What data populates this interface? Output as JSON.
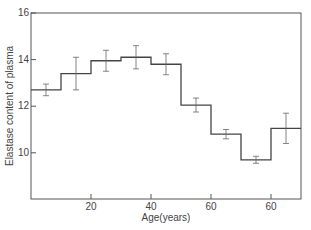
{
  "chart_data": {
    "type": "line",
    "style": "step histogram with error bars",
    "title": "",
    "xlabel": "Age(years)",
    "ylabel": "Elastase content of plasma",
    "xlim": [
      0,
      90
    ],
    "ylim": [
      8,
      16
    ],
    "x_tick_labels": [
      "20",
      "40",
      "60",
      "60"
    ],
    "x_tick_values": [
      20,
      40,
      60,
      80
    ],
    "y_ticks": [
      10,
      12,
      14,
      16
    ],
    "grid": false,
    "bins": [
      [
        0,
        10
      ],
      [
        10,
        20
      ],
      [
        20,
        30
      ],
      [
        30,
        40
      ],
      [
        40,
        50
      ],
      [
        50,
        60
      ],
      [
        60,
        70
      ],
      [
        70,
        80
      ],
      [
        80,
        90
      ]
    ],
    "x": [
      5,
      15,
      25,
      35,
      45,
      55,
      65,
      75,
      85
    ],
    "values": [
      12.7,
      13.4,
      13.95,
      14.1,
      13.8,
      12.05,
      10.8,
      9.7,
      11.05
    ],
    "error": [
      0.25,
      0.7,
      0.45,
      0.5,
      0.45,
      0.3,
      0.2,
      0.15,
      0.65
    ]
  }
}
